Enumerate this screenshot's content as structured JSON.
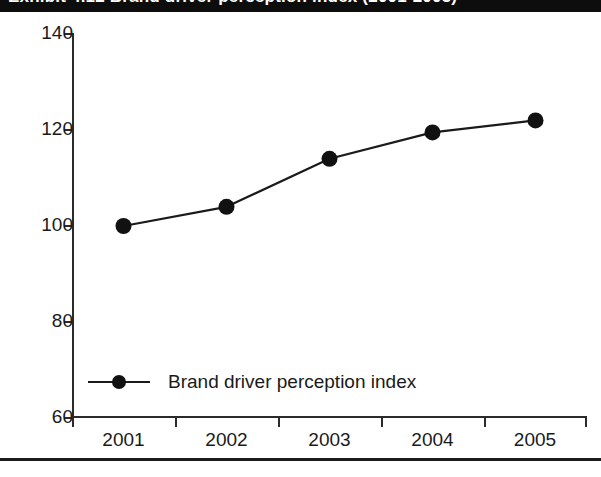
{
  "header": {
    "title_text": "Exhibit 4.12 Brand driver perception index (2001-2005)",
    "background_color": "#0d0d0d",
    "text_color": "#ffffff"
  },
  "chart_data": {
    "type": "line",
    "title": "",
    "xlabel": "",
    "ylabel": "",
    "categories": [
      "2001",
      "2002",
      "2003",
      "2004",
      "2005"
    ],
    "series": [
      {
        "name": "Brand driver perception index",
        "values": [
          100,
          104,
          114,
          119.5,
          122
        ],
        "color": "#1a1a1a",
        "marker": "circle"
      }
    ],
    "ylim": [
      60,
      140
    ],
    "ytick_labels": [
      "140",
      "120",
      "100",
      "80",
      "60"
    ],
    "ytick_values": [
      140,
      120,
      100,
      80,
      60
    ],
    "grid": false,
    "legend_position": "bottom-left",
    "legend_entries": [
      "Brand driver perception index"
    ],
    "annotations": []
  },
  "colors": {
    "line": "#1a1a1a",
    "marker": "#111111",
    "axis": "#2b2b2b",
    "text": "#1a1a1a",
    "background": "#ffffff",
    "rule": "#1c1c1c"
  }
}
